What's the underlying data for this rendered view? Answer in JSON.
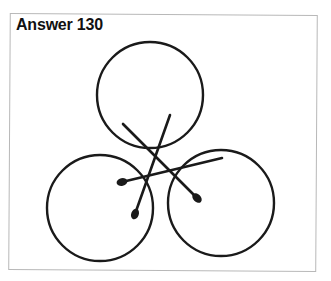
{
  "title": "Answer 130",
  "colors": {
    "stroke": "#1a1a1a",
    "frame": "#b8b8b8",
    "background": "#ffffff"
  },
  "circles": [
    {
      "name": "top-circle",
      "cx": 150,
      "cy": 95,
      "r": 53
    },
    {
      "name": "left-circle",
      "cx": 100,
      "cy": 208,
      "r": 53
    },
    {
      "name": "right-circle",
      "cx": 221,
      "cy": 203,
      "r": 53
    }
  ],
  "matches": [
    {
      "name": "match-a",
      "x1": 123,
      "y1": 124,
      "x2": 197,
      "y2": 198
    },
    {
      "name": "match-b",
      "x1": 170,
      "y1": 115,
      "x2": 135,
      "y2": 214
    },
    {
      "name": "match-c",
      "x1": 222,
      "y1": 158,
      "x2": 122,
      "y2": 182
    }
  ]
}
